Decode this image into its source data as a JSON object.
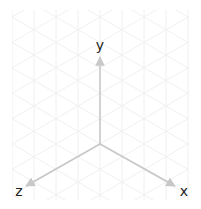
{
  "diagram": {
    "type": "isometric-axes",
    "origin": [
      100,
      144
    ],
    "axes": [
      {
        "name": "x",
        "label": "x",
        "tip": [
          175,
          186
        ],
        "label_pos": [
          184,
          196
        ]
      },
      {
        "name": "y",
        "label": "y",
        "tip": [
          100,
          57
        ],
        "label_pos": [
          100,
          50
        ]
      },
      {
        "name": "z",
        "label": "z",
        "tip": [
          26,
          186
        ],
        "label_pos": [
          19,
          196
        ]
      }
    ],
    "colors": {
      "axis": "#c8c8c8",
      "grid": "#f0f0f0",
      "label": "#222222",
      "background": "#ffffff"
    },
    "grid": {
      "x0": 12,
      "x1": 189,
      "y0": 10,
      "y1": 200,
      "spacing": 22
    }
  }
}
